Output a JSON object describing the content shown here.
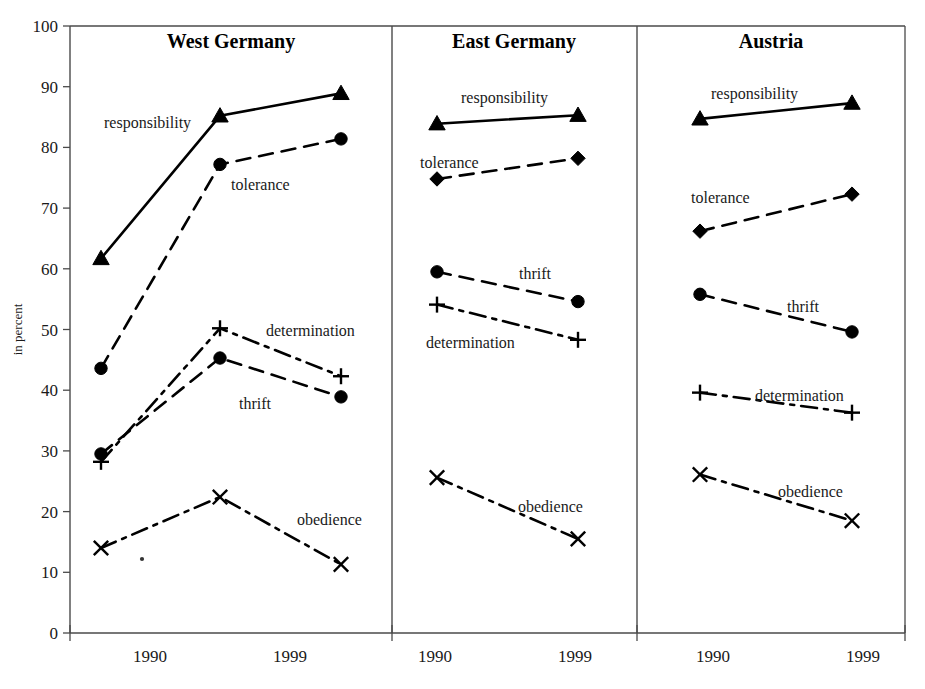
{
  "figure": {
    "ylabel": "in percent",
    "y_ticks": [
      "0",
      "10",
      "20",
      "30",
      "40",
      "50",
      "60",
      "70",
      "80",
      "90",
      "100"
    ],
    "x_ticks": [
      "1990",
      "1999"
    ]
  },
  "panels": [
    {
      "title": "West Germany"
    },
    {
      "title": "East Germany"
    },
    {
      "title": "Austria"
    }
  ],
  "series_labels": {
    "responsibility": "responsibility",
    "tolerance": "tolerance",
    "thrift": "thrift",
    "determination": "determination",
    "obedience": "obedience"
  },
  "chart_data": {
    "type": "line",
    "title": "",
    "xlabel": "",
    "ylabel": "in percent",
    "ylim": [
      0,
      100
    ],
    "ygrid": false,
    "legend": "inline-labels",
    "panels": [
      {
        "name": "West Germany",
        "x": [
          1990,
          1995,
          1999
        ],
        "x_tick_labels": [
          "1990",
          "1999"
        ],
        "series": [
          {
            "name": "responsibility",
            "marker": "triangle",
            "linestyle": "solid",
            "values": [
              61.7,
              85.2,
              88.9
            ]
          },
          {
            "name": "tolerance",
            "marker": "circle",
            "linestyle": "dashed",
            "values": [
              43.6,
              77.2,
              81.4
            ]
          },
          {
            "name": "determination",
            "marker": "plus",
            "linestyle": "dashdot",
            "values": [
              28.2,
              50.2,
              42.3
            ]
          },
          {
            "name": "thrift",
            "marker": "circle",
            "linestyle": "dashed",
            "values": [
              29.5,
              45.3,
              38.9
            ]
          },
          {
            "name": "obedience",
            "marker": "cross",
            "linestyle": "dashdot",
            "values": [
              14.0,
              22.4,
              11.3
            ]
          }
        ]
      },
      {
        "name": "East Germany",
        "x": [
          1990,
          1999
        ],
        "x_tick_labels": [
          "1990",
          "1999"
        ],
        "series": [
          {
            "name": "responsibility",
            "marker": "triangle",
            "linestyle": "solid",
            "values": [
              83.9,
              85.3
            ]
          },
          {
            "name": "tolerance",
            "marker": "diamond",
            "linestyle": "dashed",
            "values": [
              74.8,
              78.2
            ]
          },
          {
            "name": "thrift",
            "marker": "circle",
            "linestyle": "dashed",
            "values": [
              59.5,
              54.6
            ]
          },
          {
            "name": "determination",
            "marker": "plus",
            "linestyle": "dashdot",
            "values": [
              54.1,
              48.3
            ]
          },
          {
            "name": "obedience",
            "marker": "cross",
            "linestyle": "dashdot",
            "values": [
              25.6,
              15.5
            ]
          }
        ]
      },
      {
        "name": "Austria",
        "x": [
          1990,
          1999
        ],
        "x_tick_labels": [
          "1990",
          "1999"
        ],
        "series": [
          {
            "name": "responsibility",
            "marker": "triangle",
            "linestyle": "solid",
            "values": [
              84.7,
              87.3
            ]
          },
          {
            "name": "tolerance",
            "marker": "diamond",
            "linestyle": "dashed",
            "values": [
              66.2,
              72.3
            ]
          },
          {
            "name": "thrift",
            "marker": "circle",
            "linestyle": "dashed",
            "values": [
              55.8,
              49.6
            ]
          },
          {
            "name": "determination",
            "marker": "plus",
            "linestyle": "dashdot",
            "values": [
              39.6,
              36.3
            ]
          },
          {
            "name": "obedience",
            "marker": "cross",
            "linestyle": "dashdot",
            "values": [
              26.1,
              18.5
            ]
          }
        ]
      }
    ]
  },
  "annotations": [
    {
      "panel": 0,
      "series": "responsibility",
      "text": "responsibility",
      "x": 104,
      "y": 128,
      "anchor": "start"
    },
    {
      "panel": 0,
      "series": "tolerance",
      "text": "tolerance",
      "x": 231,
      "y": 190,
      "anchor": "start"
    },
    {
      "panel": 0,
      "series": "determination",
      "text": "determination",
      "x": 266,
      "y": 336,
      "anchor": "start"
    },
    {
      "panel": 0,
      "series": "thrift",
      "text": "thrift",
      "x": 239,
      "y": 409,
      "anchor": "start"
    },
    {
      "panel": 0,
      "series": "obedience",
      "text": "obedience",
      "x": 297,
      "y": 525,
      "anchor": "start"
    },
    {
      "panel": 1,
      "series": "responsibility",
      "text": "responsibility",
      "x": 461,
      "y": 103,
      "anchor": "start"
    },
    {
      "panel": 1,
      "series": "tolerance",
      "text": "tolerance",
      "x": 420,
      "y": 168,
      "anchor": "start"
    },
    {
      "panel": 1,
      "series": "thrift",
      "text": "thrift",
      "x": 519,
      "y": 279,
      "anchor": "start"
    },
    {
      "panel": 1,
      "series": "determination",
      "text": "determination",
      "x": 426,
      "y": 348,
      "anchor": "start"
    },
    {
      "panel": 1,
      "series": "obedience",
      "text": "obedience",
      "x": 518,
      "y": 512,
      "anchor": "start"
    },
    {
      "panel": 2,
      "series": "responsibility",
      "text": "responsibility",
      "x": 711,
      "y": 99,
      "anchor": "start"
    },
    {
      "panel": 2,
      "series": "tolerance",
      "text": "tolerance",
      "x": 691,
      "y": 203,
      "anchor": "start"
    },
    {
      "panel": 2,
      "series": "thrift",
      "text": "thrift",
      "x": 787,
      "y": 312,
      "anchor": "start"
    },
    {
      "panel": 2,
      "series": "determination",
      "text": "determination",
      "x": 755,
      "y": 401,
      "anchor": "start"
    },
    {
      "panel": 2,
      "series": "obedience",
      "text": "obedience",
      "x": 778,
      "y": 497,
      "anchor": "start"
    }
  ],
  "geometry": {
    "plot_top": 26,
    "plot_bottom": 633,
    "y_min": 0,
    "y_max": 100,
    "panel_bounds": [
      {
        "left": 70,
        "right": 392
      },
      {
        "left": 392,
        "right": 637
      },
      {
        "left": 637,
        "right": 905
      }
    ],
    "panel_x_positions": [
      [
        101,
        220,
        341
      ],
      [
        437,
        578
      ],
      [
        700,
        852
      ]
    ],
    "panel_tick_positions": [
      [
        150,
        290
      ],
      [
        435,
        575
      ],
      [
        713,
        863
      ]
    ],
    "panel_title_positions": [
      {
        "x": 231,
        "y": 48
      },
      {
        "x": 514,
        "y": 48
      },
      {
        "x": 771,
        "y": 48
      }
    ]
  }
}
